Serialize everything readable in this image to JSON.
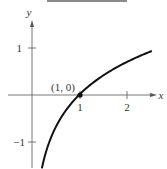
{
  "chart_data": {
    "type": "line",
    "title": "",
    "function": "y = ln x",
    "xlabel": "x",
    "ylabel": "y",
    "xlim": [
      -0.5,
      2.7
    ],
    "ylim": [
      -1.5,
      1.6
    ],
    "x_ticks": [
      1,
      2
    ],
    "x_tick_labels": [
      "1",
      "2"
    ],
    "y_ticks": [
      1,
      -1
    ],
    "y_tick_labels": [
      "1",
      "−1"
    ],
    "grid": false,
    "legend": null,
    "series": [
      {
        "name": "ln x",
        "x": [
          0.21,
          0.3,
          0.4,
          0.5,
          0.6,
          0.7,
          0.8,
          0.9,
          1.0,
          1.25,
          1.5,
          1.75,
          2.0,
          2.25,
          2.55
        ],
        "y": [
          -1.56,
          -1.2,
          -0.92,
          -0.69,
          -0.51,
          -0.36,
          -0.22,
          -0.11,
          0.0,
          0.22,
          0.41,
          0.56,
          0.69,
          0.81,
          0.94
        ]
      }
    ],
    "annotations": [
      {
        "text": "(1, 0)",
        "x": 1,
        "y": 0,
        "marker": "point"
      }
    ]
  },
  "labels": {
    "x_axis": "x",
    "y_axis": "y",
    "x_tick_1": "1",
    "x_tick_2": "2",
    "y_tick_1": "1",
    "y_tick_neg1": "−1",
    "point": "(1, 0)"
  },
  "colors": {
    "axis": "#555555",
    "curve": "#111111",
    "text": "#333333",
    "top_bar": "#8a8a8a"
  }
}
